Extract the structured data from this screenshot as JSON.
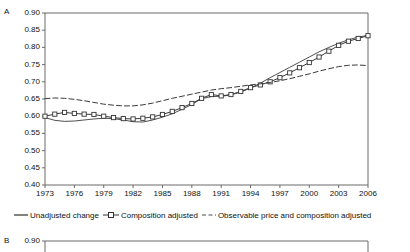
{
  "figure": {
    "panels": [
      {
        "letter": "A",
        "id": "panel-a"
      },
      {
        "letter": "B",
        "id": "panel-b"
      }
    ]
  },
  "legend": {
    "position": "below-axis",
    "items": [
      {
        "label": "Unadjusted change",
        "style": "solid-line",
        "marker": "none",
        "color": "#4d4d4d"
      },
      {
        "label": "Composition adjusted",
        "style": "solid-line",
        "marker": "open-square",
        "color": "#333333"
      },
      {
        "label": "Observable price and composition adjusted",
        "style": "dashed-line",
        "marker": "none",
        "color": "#4d4d4d"
      }
    ]
  },
  "panel_b": {
    "letter": "B",
    "y_top_label": "0.90"
  },
  "chart_data": {
    "type": "line",
    "title": "",
    "subtitle": "",
    "xlabel": "",
    "ylabel": "",
    "panel": "A",
    "grid": false,
    "legend_position": "bottom",
    "xlim": [
      1973,
      2006
    ],
    "ylim": [
      0.4,
      0.9
    ],
    "ytick_labels": [
      "0.90",
      "0.85",
      "0.80",
      "0.75",
      "0.70",
      "0.65",
      "0.60",
      "0.55",
      "0.50",
      "0.45",
      "0.40"
    ],
    "ytick_values": [
      0.9,
      0.85,
      0.8,
      0.75,
      0.7,
      0.65,
      0.6,
      0.55,
      0.5,
      0.45,
      0.4
    ],
    "xtick_labels": [
      "1973",
      "1976",
      "1979",
      "1982",
      "1985",
      "1988",
      "1991",
      "1994",
      "1997",
      "2000",
      "2003",
      "2006"
    ],
    "xtick_values": [
      1973,
      1976,
      1979,
      1982,
      1985,
      1988,
      1991,
      1994,
      1997,
      2000,
      2003,
      2006
    ],
    "x": [
      1973,
      1974,
      1975,
      1976,
      1977,
      1978,
      1979,
      1980,
      1981,
      1982,
      1983,
      1984,
      1985,
      1986,
      1987,
      1988,
      1989,
      1990,
      1991,
      1992,
      1993,
      1994,
      1995,
      1996,
      1997,
      1998,
      1999,
      2000,
      2001,
      2002,
      2003,
      2004,
      2005,
      2006
    ],
    "series": [
      {
        "name": "Unadjusted change",
        "style": "solid-line",
        "marker": "none",
        "values": [
          0.596,
          0.588,
          0.585,
          0.586,
          0.589,
          0.592,
          0.594,
          0.593,
          0.589,
          0.584,
          0.583,
          0.589,
          0.597,
          0.607,
          0.62,
          0.634,
          0.651,
          0.657,
          0.658,
          0.662,
          0.67,
          0.682,
          0.696,
          0.712,
          0.727,
          0.742,
          0.757,
          0.772,
          0.787,
          0.8,
          0.812,
          0.822,
          0.83,
          0.835
        ]
      },
      {
        "name": "Composition adjusted",
        "style": "solid-line",
        "marker": "open-square",
        "values": [
          0.6,
          0.606,
          0.611,
          0.608,
          0.606,
          0.605,
          0.6,
          0.596,
          0.593,
          0.592,
          0.594,
          0.598,
          0.605,
          0.614,
          0.625,
          0.637,
          0.652,
          0.663,
          0.659,
          0.663,
          0.672,
          0.683,
          0.691,
          0.7,
          0.712,
          0.726,
          0.741,
          0.756,
          0.772,
          0.789,
          0.806,
          0.818,
          0.826,
          0.834
        ]
      },
      {
        "name": "Observable price and composition adjusted",
        "style": "dashed-line",
        "marker": "none",
        "values": [
          0.651,
          0.653,
          0.652,
          0.649,
          0.645,
          0.64,
          0.635,
          0.632,
          0.63,
          0.63,
          0.633,
          0.638,
          0.645,
          0.652,
          0.658,
          0.664,
          0.67,
          0.676,
          0.68,
          0.683,
          0.687,
          0.691,
          0.694,
          0.698,
          0.703,
          0.709,
          0.716,
          0.723,
          0.731,
          0.738,
          0.744,
          0.748,
          0.749,
          0.747
        ]
      }
    ]
  }
}
